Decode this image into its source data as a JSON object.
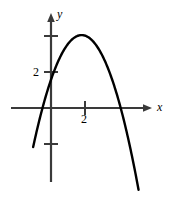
{
  "figure": {
    "name": "parabola-graph",
    "width": 172,
    "height": 201,
    "background_color": "#ffffff",
    "curve_color": "#000000",
    "axis_color": "#3a3a3a"
  },
  "axes": {
    "x_axis_label": "x",
    "y_axis_label": "y",
    "x_ticks": [
      {
        "value": 2,
        "label": "2"
      }
    ],
    "y_ticks": [
      {
        "value": 2,
        "label": "2"
      },
      {
        "value": 4,
        "label": ""
      },
      {
        "value": -2,
        "label": ""
      }
    ],
    "origin_px": {
      "x": 51,
      "y": 108
    },
    "unit_px": {
      "x": 17,
      "y": 18
    },
    "x_range": [
      -2.35,
      5.9
    ],
    "y_range": [
      -4.1,
      5.4
    ],
    "grid": false,
    "arrowheads": {
      "x_positive": true,
      "y_positive": true
    }
  },
  "chart_data": {
    "type": "line",
    "title": "",
    "xlabel": "x",
    "ylabel": "y",
    "grid": false,
    "legend": null,
    "xlim": [
      -2.35,
      5.9
    ],
    "ylim": [
      -4.1,
      5.4
    ],
    "xticks": [
      2
    ],
    "xticklabels": [
      "2"
    ],
    "yticks": [
      -2,
      2,
      4
    ],
    "yticklabels": [
      "",
      "2",
      ""
    ],
    "series": [
      {
        "name": "parabola",
        "equation": "y = -x^2 + 4x",
        "orientation": "opens-downward",
        "vertex": [
          1.8,
          4.05
        ],
        "x_intercepts": [
          0.0,
          4.1
        ],
        "y_intercept": 0.0,
        "color": "#000000",
        "linewidth": 2.4,
        "x": [
          -1.05,
          -0.8,
          -0.5,
          -0.2,
          0.0,
          0.35,
          0.7,
          1.05,
          1.4,
          1.8,
          2.1,
          2.45,
          2.8,
          3.15,
          3.5,
          3.8,
          4.1,
          4.4,
          4.7,
          5.0,
          5.15
        ],
        "y": [
          -5.3,
          -3.84,
          -2.25,
          -0.84,
          0.0,
          1.28,
          2.31,
          3.1,
          3.64,
          4.05,
          3.99,
          3.79,
          3.36,
          2.68,
          1.75,
          0.76,
          -0.41,
          -1.76,
          -3.29,
          -5.0,
          -5.9
        ]
      }
    ]
  }
}
